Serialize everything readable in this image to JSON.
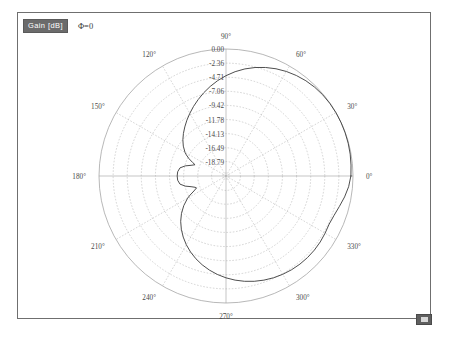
{
  "header": {
    "gain_chip_label": "Gain [dB]",
    "phi_label": "Φ=0"
  },
  "corner_button": {
    "name": "plot-options-button",
    "glyph": ""
  },
  "caption": {
    "text": ""
  },
  "chart_data": {
    "type": "line",
    "plot_style": "polar",
    "title": "Gain [dB]",
    "subtitle": "Φ=0",
    "xlabel": "",
    "ylabel": "Gain [dB]",
    "angle_unit": "degrees",
    "grid": true,
    "legend_position": "top-left",
    "angular_tick_labels": [
      "0°",
      "30°",
      "60°",
      "90°",
      "120°",
      "150°",
      "180°",
      "210°",
      "240°",
      "270°",
      "300°",
      "330°"
    ],
    "angular_ticks": [
      0,
      30,
      60,
      90,
      120,
      150,
      180,
      210,
      240,
      270,
      300,
      330
    ],
    "radial_tick_labels": [
      "0.00",
      "-2.36",
      "-4.71",
      "-7.06",
      "-9.42",
      "-11.78",
      "-14.13",
      "-16.49",
      "-18.79"
    ],
    "radial_ticks": [
      0.0,
      -2.36,
      -4.71,
      -7.06,
      -9.42,
      -11.78,
      -14.13,
      -16.49,
      -18.79
    ],
    "rlim": [
      -21.2,
      0.0
    ],
    "series": [
      {
        "name": "Gain",
        "theta": [
          0,
          5,
          10,
          15,
          20,
          25,
          30,
          35,
          40,
          45,
          50,
          55,
          60,
          65,
          70,
          75,
          80,
          85,
          90,
          95,
          100,
          105,
          110,
          115,
          120,
          125,
          130,
          135,
          140,
          145,
          150,
          152,
          155,
          158,
          160,
          163,
          166,
          170,
          175,
          180,
          185,
          190,
          194,
          197,
          200,
          202,
          205,
          208,
          210,
          215,
          220,
          225,
          230,
          235,
          240,
          245,
          250,
          255,
          260,
          265,
          270,
          275,
          280,
          285,
          290,
          295,
          300,
          305,
          310,
          315,
          320,
          325,
          330,
          335,
          340,
          345,
          350,
          355,
          360
        ],
        "values": [
          -0.35,
          -0.25,
          -0.15,
          -0.08,
          -0.04,
          -0.02,
          -0.02,
          -0.05,
          -0.12,
          -0.25,
          -0.45,
          -0.72,
          -1.05,
          -1.45,
          -1.92,
          -2.45,
          -3.05,
          -3.72,
          -4.45,
          -5.22,
          -6.02,
          -6.82,
          -7.62,
          -8.38,
          -9.12,
          -9.82,
          -10.5,
          -11.15,
          -11.8,
          -12.5,
          -13.3,
          -13.7,
          -14.4,
          -15.2,
          -15.7,
          -15.1,
          -14.2,
          -13.4,
          -13.1,
          -13.05,
          -13.1,
          -13.4,
          -14.2,
          -15.1,
          -15.7,
          -15.9,
          -15.3,
          -14.4,
          -13.8,
          -12.6,
          -11.5,
          -10.5,
          -9.6,
          -8.75,
          -7.95,
          -7.2,
          -6.5,
          -5.85,
          -5.25,
          -4.7,
          -4.2,
          -3.75,
          -3.35,
          -3.0,
          -2.7,
          -2.45,
          -2.25,
          -2.1,
          -2.0,
          -1.95,
          -1.95,
          -2.0,
          -2.1,
          -2.2,
          -2.0,
          -1.6,
          -1.1,
          -0.65,
          -0.35
        ]
      }
    ]
  }
}
